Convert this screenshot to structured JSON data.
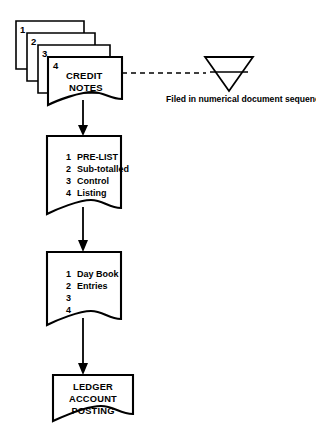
{
  "diagram": {
    "type": "document-flowchart",
    "colors": {
      "line": "#000000",
      "fill": "#ffffff",
      "background": "#ffffff"
    },
    "document_stack": {
      "name": "credit-notes-stack",
      "copies": [
        "1",
        "2",
        "3",
        "4"
      ],
      "front_label_line1": "CREDIT",
      "front_label_line2": "NOTES"
    },
    "file_symbol": {
      "name": "file-triangle",
      "shape": "inverted-triangle",
      "caption": "Filed in numerical document sequence",
      "link_style": "dashed"
    },
    "steps": [
      {
        "name": "pre-list",
        "rows": [
          {
            "num": "1",
            "text": "PRE-LIST"
          },
          {
            "num": "2",
            "text": "Sub-totalled"
          },
          {
            "num": "3",
            "text": "Control"
          },
          {
            "num": "4",
            "text": "Listing"
          }
        ]
      },
      {
        "name": "day-book",
        "rows": [
          {
            "num": "1",
            "text": "Day Book"
          },
          {
            "num": "2",
            "text": "Entries"
          },
          {
            "num": "3",
            "text": ""
          },
          {
            "num": "4",
            "text": ""
          }
        ]
      },
      {
        "name": "ledger-account-posting",
        "lines": [
          "LEDGER",
          "ACCOUNT",
          "POSTING"
        ]
      }
    ]
  }
}
